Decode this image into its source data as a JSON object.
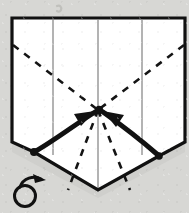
{
  "diagram": {
    "kind": "origami-fold-diagram",
    "title": "",
    "caption": "",
    "background_color": "#d7d7d4",
    "paper_color": "#ffffff",
    "ink_color": "#111111",
    "crease_color": "#9a9a9a",
    "outline_width": 3.2,
    "paper_outline": {
      "name": "folded-paper-shape",
      "points": "12,18 185,18 185,142 159,156 98,190 34,152 12,142"
    },
    "valley_creases": [
      {
        "name": "crease-left-vertical",
        "x1": 53,
        "y1": 20,
        "x2": 53,
        "y2": 155
      },
      {
        "name": "crease-center-vertical",
        "x1": 98,
        "y1": 20,
        "x2": 98,
        "y2": 189
      },
      {
        "name": "crease-right-vertical",
        "x1": 142,
        "y1": 20,
        "x2": 142,
        "y2": 155
      }
    ],
    "dashed_fold_lines": [
      {
        "name": "dashed-left-diagonal",
        "x1": 13,
        "y1": 45,
        "x2": 98,
        "y2": 110
      },
      {
        "name": "dashed-right-diagonal",
        "x1": 184,
        "y1": 45,
        "x2": 98,
        "y2": 110
      },
      {
        "name": "dashed-center-left-diagonal",
        "x1": 98,
        "y1": 110,
        "x2": 68,
        "y2": 190
      },
      {
        "name": "dashed-center-right-diagonal",
        "x1": 98,
        "y1": 110,
        "x2": 130,
        "y2": 190
      }
    ],
    "reference_points": [
      {
        "name": "point-left",
        "cx": 34,
        "cy": 152,
        "r": 4.0
      },
      {
        "name": "point-center",
        "cx": 99,
        "cy": 110,
        "r": 4.2
      },
      {
        "name": "point-right",
        "cx": 159,
        "cy": 156,
        "r": 3.8
      }
    ],
    "motion_arrows": [
      {
        "name": "fold-arrow-left",
        "path": "M 36,151 C 55,140 76,124 95,112",
        "head": "95,111 74,114 81,126",
        "width": 5.0
      },
      {
        "name": "fold-arrow-right",
        "path": "M 158,155 C 142,141 120,124 103,112",
        "head": "103,111 124,115 116,127",
        "width": 5.0
      }
    ],
    "symbols": [
      {
        "name": "turn-over-symbol",
        "label": "rotate / turn over",
        "circle": {
          "cx": 25,
          "cy": 196,
          "r": 10.5,
          "stroke": 3.0
        },
        "tail": "M 20,187 C 23,178 34,175 41,179",
        "head": "46,180 33,174 35,183"
      }
    ],
    "artifacts": [
      {
        "name": "page-bleed-mark",
        "d": "M 57,6 C 60,5 62,7 61,10 C 60,12 58,12 57,11",
        "opacity": 0.3
      }
    ]
  }
}
